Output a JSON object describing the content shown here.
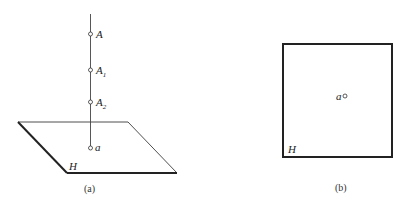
{
  "figure_a": {
    "caption": "(a)",
    "plane_label": "H",
    "points": [
      {
        "name": "A",
        "sub": ""
      },
      {
        "name": "A",
        "sub": "1"
      },
      {
        "name": "A",
        "sub": "2"
      },
      {
        "name": "a",
        "sub": ""
      }
    ]
  },
  "figure_b": {
    "caption": "(b)",
    "plane_label": "H",
    "point_label": "a"
  },
  "colors": {
    "line": "#222222",
    "background": "#ffffff"
  }
}
